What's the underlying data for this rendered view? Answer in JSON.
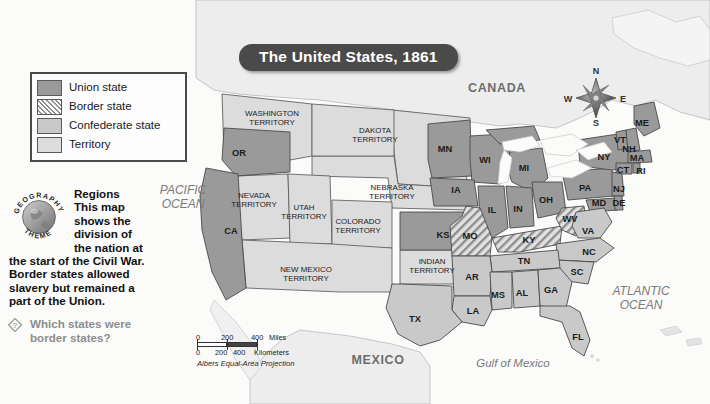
{
  "map": {
    "title": "The United States, 1861",
    "projection_note": "Albers Equal-Area Projection"
  },
  "legend": {
    "items": [
      {
        "label": "Union state",
        "swatch": "union-swatch",
        "color": "#9a9a9a"
      },
      {
        "label": "Border state",
        "swatch": "border-hatched-swatch",
        "color": "#d9d9d9"
      },
      {
        "label": "Confederate state",
        "swatch": "confederate-swatch",
        "color": "#c9c9c9"
      },
      {
        "label": "Territory",
        "swatch": "territory-swatch",
        "color": "#dcdcdc"
      }
    ]
  },
  "geography_theme": {
    "badge_text_top": "GEOGRAPHY",
    "badge_text_bottom": "THEME",
    "heading": "Regions",
    "body_line1": "This map",
    "body_line2": "shows the",
    "body_line3": "division of",
    "body_line4": "the nation at",
    "body_line5": "the start of the Civil War.",
    "body_line6": "Border states allowed",
    "body_line7": "slavery but remained a",
    "body_line8": "part of the Union.",
    "question_line1": "Which states were",
    "question_line2": "border states?",
    "question_icon": "diamond-question-icon"
  },
  "scale_bar": {
    "miles_label": "Miles",
    "miles_ticks": [
      "0",
      "200",
      "400"
    ],
    "km_label": "Kilometers",
    "km_ticks": [
      "0",
      "200",
      "400"
    ],
    "projection": "Albers Equal-Area Projection"
  },
  "compass": {
    "north": "N",
    "east": "E",
    "south": "S",
    "west": "W",
    "icon": "compass-rose-icon"
  },
  "labels": {
    "countries": [
      {
        "name": "CANADA",
        "x": 497,
        "y": 88
      },
      {
        "name": "MEXICO",
        "x": 378,
        "y": 360
      }
    ],
    "oceans": [
      {
        "name": "PACIFIC",
        "name2": "OCEAN",
        "x": 183,
        "y": 197
      },
      {
        "name": "ATLANTIC",
        "name2": "OCEAN",
        "x": 641,
        "y": 298
      }
    ],
    "water_bodies": [
      {
        "name": "Gulf of Mexico",
        "x": 513,
        "y": 363
      }
    ],
    "territories": [
      {
        "name": "WASHINGTON",
        "name2": "TERRITORY",
        "x": 272,
        "y": 118
      },
      {
        "name": "DAKOTA",
        "name2": "TERRITORY",
        "x": 375,
        "y": 135
      },
      {
        "name": "NEBRASKA",
        "name2": "TERRITORY",
        "x": 392,
        "y": 192
      },
      {
        "name": "NEVADA",
        "name2": "TERRITORY",
        "x": 254,
        "y": 200
      },
      {
        "name": "UTAH",
        "name2": "TERRITORY",
        "x": 304,
        "y": 212
      },
      {
        "name": "COLORADO",
        "name2": "TERRITORY",
        "x": 358,
        "y": 226
      },
      {
        "name": "NEW MEXICO",
        "name2": "TERRITORY",
        "x": 306,
        "y": 274
      },
      {
        "name": "INDIAN",
        "name2": "TERRITORY",
        "x": 432,
        "y": 266
      }
    ],
    "states": [
      {
        "abbr": "OR",
        "x": 239,
        "y": 153,
        "type": "union"
      },
      {
        "abbr": "CA",
        "x": 231,
        "y": 231,
        "type": "union"
      },
      {
        "abbr": "MN",
        "x": 445,
        "y": 149,
        "type": "union"
      },
      {
        "abbr": "WI",
        "x": 485,
        "y": 160,
        "type": "union"
      },
      {
        "abbr": "MI",
        "x": 524,
        "y": 168,
        "type": "union"
      },
      {
        "abbr": "IA",
        "x": 456,
        "y": 190,
        "type": "union"
      },
      {
        "abbr": "IL",
        "x": 492,
        "y": 210,
        "type": "union"
      },
      {
        "abbr": "IN",
        "x": 518,
        "y": 209,
        "type": "union"
      },
      {
        "abbr": "OH",
        "x": 546,
        "y": 200,
        "type": "union"
      },
      {
        "abbr": "PA",
        "x": 585,
        "y": 188,
        "type": "union"
      },
      {
        "abbr": "NY",
        "x": 604,
        "y": 157,
        "type": "union"
      },
      {
        "abbr": "ME",
        "x": 642,
        "y": 123,
        "type": "union"
      },
      {
        "abbr": "VT",
        "x": 620,
        "y": 140,
        "type": "union"
      },
      {
        "abbr": "NH",
        "x": 629,
        "y": 149,
        "type": "union"
      },
      {
        "abbr": "MA",
        "x": 637,
        "y": 158,
        "type": "union"
      },
      {
        "abbr": "CT",
        "x": 623,
        "y": 170,
        "type": "union"
      },
      {
        "abbr": "RI",
        "x": 641,
        "y": 171,
        "type": "union"
      },
      {
        "abbr": "NJ",
        "x": 619,
        "y": 189,
        "type": "union"
      },
      {
        "abbr": "MD",
        "x": 599,
        "y": 203,
        "type": "union"
      },
      {
        "abbr": "DE",
        "x": 619,
        "y": 203,
        "type": "union"
      },
      {
        "abbr": "KS",
        "x": 443,
        "y": 235,
        "type": "union"
      },
      {
        "abbr": "MO",
        "x": 470,
        "y": 236,
        "type": "border"
      },
      {
        "abbr": "KY",
        "x": 529,
        "y": 240,
        "type": "border"
      },
      {
        "abbr": "WV",
        "x": 570,
        "y": 219,
        "type": "border"
      },
      {
        "abbr": "VA",
        "x": 588,
        "y": 231,
        "type": "confederate"
      },
      {
        "abbr": "NC",
        "x": 589,
        "y": 252,
        "type": "confederate"
      },
      {
        "abbr": "SC",
        "x": 577,
        "y": 272,
        "type": "confederate"
      },
      {
        "abbr": "TN",
        "x": 524,
        "y": 261,
        "type": "confederate"
      },
      {
        "abbr": "AR",
        "x": 472,
        "y": 277,
        "type": "confederate"
      },
      {
        "abbr": "MS",
        "x": 498,
        "y": 295,
        "type": "confederate"
      },
      {
        "abbr": "AL",
        "x": 522,
        "y": 293,
        "type": "confederate"
      },
      {
        "abbr": "GA",
        "x": 551,
        "y": 290,
        "type": "confederate"
      },
      {
        "abbr": "LA",
        "x": 473,
        "y": 311,
        "type": "confederate"
      },
      {
        "abbr": "FL",
        "x": 578,
        "y": 337,
        "type": "confederate"
      },
      {
        "abbr": "TX",
        "x": 415,
        "y": 319,
        "type": "confederate"
      }
    ]
  },
  "colors": {
    "union": "#9a9a9a",
    "confederate": "#c9c9c9",
    "territory": "#dcdcdc",
    "border_base": "#d9d9d9",
    "water": "#fafafa",
    "outline": "#4a4a4a",
    "canada_mexico": "#ededed",
    "title_bg": "#4a4a4a"
  }
}
